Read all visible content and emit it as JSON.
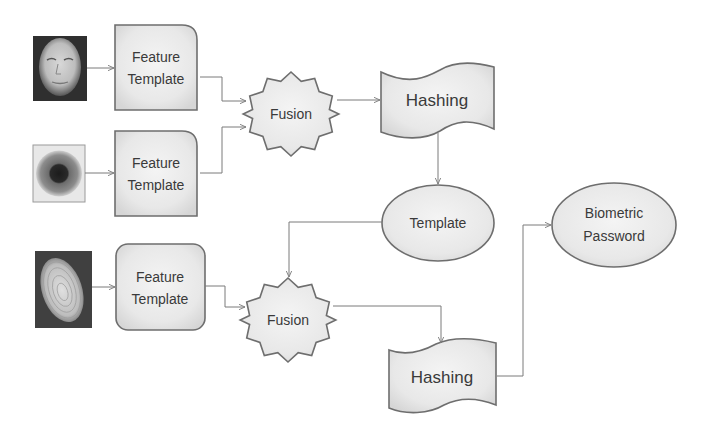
{
  "diagram": {
    "inputs": [
      {
        "id": "face",
        "icon": "face-image-icon"
      },
      {
        "id": "iris",
        "icon": "iris-image-icon"
      },
      {
        "id": "fingerprint",
        "icon": "fingerprint-image-icon"
      }
    ],
    "nodes": {
      "feature_template_1": {
        "line1": "Feature",
        "line2": "Template"
      },
      "feature_template_2": {
        "line1": "Feature",
        "line2": "Template"
      },
      "feature_template_3": {
        "line1": "Feature",
        "line2": "Template"
      },
      "fusion_1": {
        "label": "Fusion"
      },
      "fusion_2": {
        "label": "Fusion"
      },
      "hashing_1": {
        "label": "Hashing"
      },
      "hashing_2": {
        "label": "Hashing"
      },
      "template": {
        "label": "Template"
      },
      "biometric_password": {
        "line1": "Biometric",
        "line2": "Password"
      }
    },
    "edges": [
      [
        "face",
        "feature_template_1"
      ],
      [
        "iris",
        "feature_template_2"
      ],
      [
        "fingerprint",
        "feature_template_3"
      ],
      [
        "feature_template_1",
        "fusion_1"
      ],
      [
        "feature_template_2",
        "fusion_1"
      ],
      [
        "fusion_1",
        "hashing_1"
      ],
      [
        "hashing_1",
        "template"
      ],
      [
        "template",
        "fusion_2"
      ],
      [
        "feature_template_3",
        "fusion_2"
      ],
      [
        "fusion_2",
        "hashing_2"
      ],
      [
        "hashing_2",
        "biometric_password"
      ]
    ],
    "colors": {
      "shape_fill": "#e6e6e6",
      "shape_stroke": "#6e6e6e",
      "edge": "#7a7a7a",
      "text": "#3a3a3a"
    }
  }
}
